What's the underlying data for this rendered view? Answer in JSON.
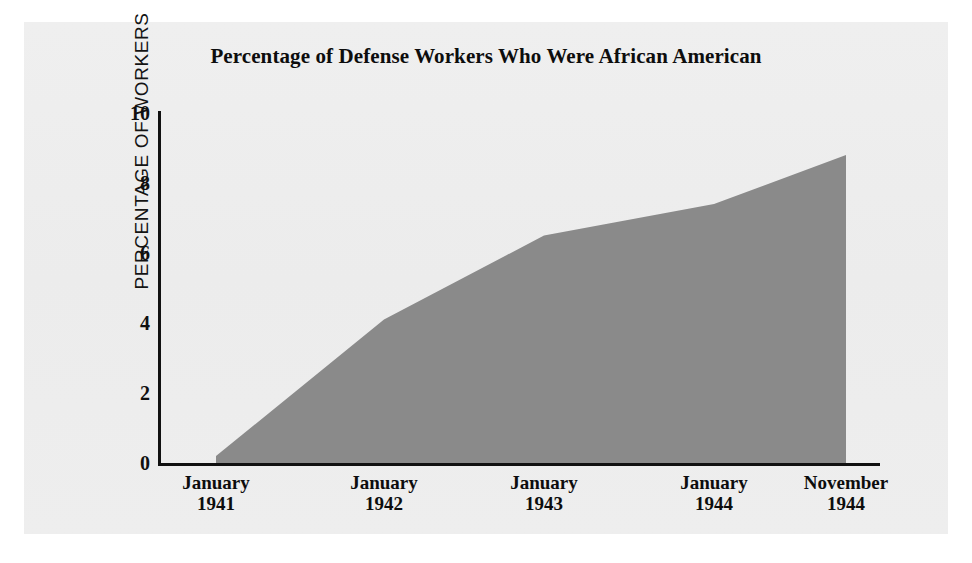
{
  "figure": {
    "title": "Percentage of Defense Workers Who Were African American",
    "background_color": "#eeeeee",
    "page_color": "#ffffff"
  },
  "chart_data": {
    "type": "area",
    "title": "Percentage of Defense Workers Who Were African American",
    "xlabel": "",
    "ylabel": "PERCENTAGE OF WORKERS",
    "categories": [
      "January 1941",
      "January 1942",
      "January 1943",
      "January 1944",
      "November 1944"
    ],
    "category_months": [
      "January",
      "January",
      "January",
      "January",
      "November"
    ],
    "category_years": [
      "1941",
      "1942",
      "1943",
      "1944",
      "1944"
    ],
    "values": [
      0.2,
      4.1,
      6.5,
      7.4,
      8.8
    ],
    "ylim": [
      0,
      10
    ],
    "y_ticks": [
      0,
      2,
      4,
      6,
      8,
      10
    ],
    "y_tick_labels": [
      "0",
      "2",
      "4",
      "6",
      "8",
      "10"
    ],
    "grid": false,
    "legend": false,
    "series": [
      {
        "name": "Percentage of defense workers who were African American",
        "values": [
          0.2,
          4.1,
          6.5,
          7.4,
          8.8
        ],
        "fill_color": "#8a8a8a"
      }
    ],
    "axis_color": "#111111"
  }
}
